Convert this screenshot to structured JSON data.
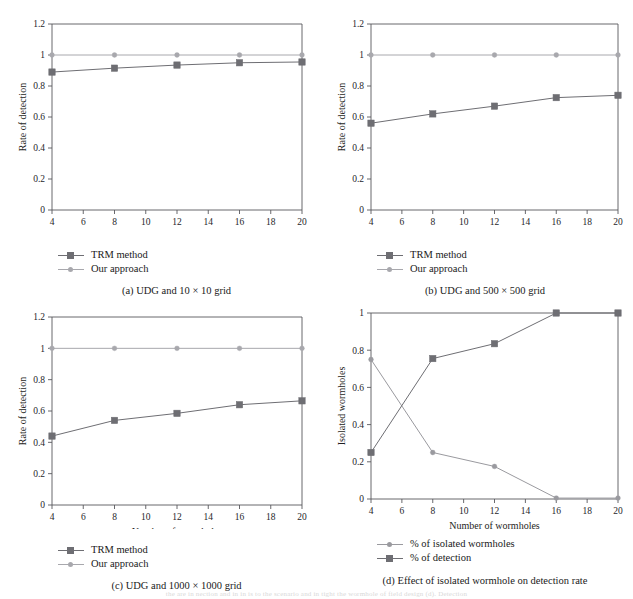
{
  "figure": {
    "background": "#ffffff",
    "axis_color": "#58585c",
    "text_color": "#1a1a1a",
    "series_colors": {
      "trm": "#6e6e73",
      "ours": "#a8a8ad",
      "isolated": "#9a9a9f",
      "detection": "#6e6e73"
    },
    "page_bleed_text": "the are in nection and in in is to the scenario and in tight the wormhole of field design (d). Detection"
  },
  "panels": [
    {
      "id": "a",
      "caption": "(a)  UDG and 10 × 10 grid",
      "xlabel": "Number of wormholes",
      "ylabel": "Rate of detection",
      "legend": [
        {
          "label": "TRM method",
          "marker": "square",
          "color_key": "trm"
        },
        {
          "label": "Our approach",
          "marker": "dot",
          "color_key": "ours"
        }
      ],
      "chart_data": {
        "type": "line",
        "title": "(a)  UDG and 10 × 10 grid",
        "xlabel": "Number of wormholes",
        "ylabel": "Rate of detection",
        "x": [
          4,
          8,
          12,
          16,
          20
        ],
        "xlim": [
          4,
          20
        ],
        "xticks": [
          4,
          6,
          8,
          10,
          12,
          14,
          16,
          18,
          20
        ],
        "ylim": [
          0,
          1.2
        ],
        "yticks": [
          0,
          0.2,
          0.4,
          0.6,
          0.8,
          1,
          1.2
        ],
        "grid": false,
        "legend_position": "below-left",
        "series": [
          {
            "name": "TRM method",
            "values": [
              0.89,
              0.915,
              0.935,
              0.95,
              0.955
            ]
          },
          {
            "name": "Our approach",
            "values": [
              1.0,
              1.0,
              1.0,
              1.0,
              1.0
            ]
          }
        ]
      }
    },
    {
      "id": "b",
      "caption": "(b)  UDG and 500 × 500 grid",
      "xlabel": "Number of wormholes",
      "ylabel": "Rate of detection",
      "legend": [
        {
          "label": "TRM method",
          "marker": "square",
          "color_key": "trm"
        },
        {
          "label": "Our approach",
          "marker": "dot",
          "color_key": "ours"
        }
      ],
      "chart_data": {
        "type": "line",
        "title": "(b)  UDG and 500 × 500 grid",
        "xlabel": "Number of wormholes",
        "ylabel": "Rate of detection",
        "x": [
          4,
          8,
          12,
          16,
          20
        ],
        "xlim": [
          4,
          20
        ],
        "xticks": [
          4,
          6,
          8,
          10,
          12,
          14,
          16,
          18,
          20
        ],
        "ylim": [
          0,
          1.2
        ],
        "yticks": [
          0,
          0.2,
          0.4,
          0.6,
          0.8,
          1,
          1.2
        ],
        "grid": false,
        "legend_position": "below-left",
        "series": [
          {
            "name": "TRM method",
            "values": [
              0.56,
              0.62,
              0.67,
              0.725,
              0.74
            ]
          },
          {
            "name": "Our approach",
            "values": [
              1.0,
              1.0,
              1.0,
              1.0,
              1.0
            ]
          }
        ]
      }
    },
    {
      "id": "c",
      "caption": "(c)  UDG and 1000 × 1000 grid",
      "xlabel": "Number of wormholes",
      "ylabel": "Rate of detection",
      "legend": [
        {
          "label": "TRM method",
          "marker": "square",
          "color_key": "trm"
        },
        {
          "label": "Our approach",
          "marker": "dot",
          "color_key": "ours"
        }
      ],
      "chart_data": {
        "type": "line",
        "title": "(c)  UDG and 1000 × 1000 grid",
        "xlabel": "Number of wormholes",
        "ylabel": "Rate of detection",
        "x": [
          4,
          8,
          12,
          16,
          20
        ],
        "xlim": [
          4,
          20
        ],
        "xticks": [
          4,
          6,
          8,
          10,
          12,
          14,
          16,
          18,
          20
        ],
        "ylim": [
          0,
          1.2
        ],
        "yticks": [
          0,
          0.2,
          0.4,
          0.6,
          0.8,
          1,
          1.2
        ],
        "grid": false,
        "legend_position": "below-left",
        "series": [
          {
            "name": "TRM method",
            "values": [
              0.44,
              0.54,
              0.585,
              0.64,
              0.665
            ]
          },
          {
            "name": "Our approach",
            "values": [
              1.0,
              1.0,
              1.0,
              1.0,
              1.0
            ]
          }
        ]
      }
    },
    {
      "id": "d",
      "caption": "(d)  Effect of isolated wormhole on detection rate",
      "xlabel": "Number of wormholes",
      "ylabel": "Isolated wormholes",
      "legend": [
        {
          "label": "% of isolated wormholes",
          "marker": "dot",
          "color_key": "isolated"
        },
        {
          "label": "% of detection",
          "marker": "square",
          "color_key": "detection"
        }
      ],
      "chart_data": {
        "type": "line",
        "title": "(d)  Effect of isolated wormhole on detection rate",
        "xlabel": "Number of wormholes",
        "ylabel": "Isolated wormholes",
        "x": [
          4,
          8,
          12,
          16,
          20
        ],
        "xlim": [
          4,
          20
        ],
        "xticks": [
          4,
          6,
          8,
          10,
          12,
          14,
          16,
          18,
          20
        ],
        "ylim": [
          0,
          1
        ],
        "yticks": [
          0,
          0.2,
          0.4,
          0.6,
          0.8,
          1
        ],
        "grid": false,
        "legend_position": "below-left",
        "series": [
          {
            "name": "% of isolated wormholes",
            "values": [
              0.75,
              0.25,
              0.175,
              0.005,
              0.005
            ]
          },
          {
            "name": "% of detection",
            "values": [
              0.25,
              0.755,
              0.835,
              1.0,
              1.0
            ]
          }
        ]
      }
    }
  ]
}
